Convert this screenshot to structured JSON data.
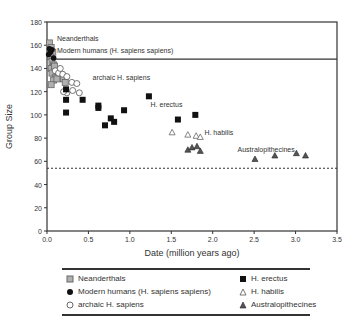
{
  "chart_data": {
    "type": "scatter",
    "title": "",
    "xlabel": "Date (million years ago)",
    "ylabel": "Group Size",
    "xlim": [
      0.0,
      3.5
    ],
    "ylim": [
      0,
      180
    ],
    "xticks": [
      "0.0",
      "0.5",
      "1.0",
      "1.5",
      "2.0",
      "2.5",
      "3.0",
      "3.5"
    ],
    "yticks": [
      "0",
      "20",
      "40",
      "60",
      "80",
      "100",
      "120",
      "140",
      "160",
      "180"
    ],
    "grid": false,
    "legend_position": "below",
    "reference_lines": [
      {
        "type": "horizontal",
        "y": 148,
        "style": "solid",
        "note": "upper band bound (Modern humans)"
      },
      {
        "type": "horizontal",
        "y": 54,
        "style": "dashed"
      }
    ],
    "annotations": [
      {
        "text": "Neanderthals",
        "x": 0.12,
        "y": 164
      },
      {
        "text": "Modern humans (H. sapiens sapiens)",
        "x": 0.12,
        "y": 153
      },
      {
        "text": "archaic H. sapiens",
        "x": 0.55,
        "y": 130
      },
      {
        "text": "H. erectus",
        "x": 1.25,
        "y": 107
      },
      {
        "text": "H. habilis",
        "x": 1.9,
        "y": 83
      },
      {
        "text": "Australopithecines",
        "x": 2.3,
        "y": 68
      }
    ],
    "series": [
      {
        "name": "Neanderthals",
        "marker": "gray-square",
        "points": [
          [
            0.03,
            162
          ],
          [
            0.05,
            158
          ],
          [
            0.07,
            154
          ],
          [
            0.04,
            150
          ],
          [
            0.06,
            146
          ],
          [
            0.08,
            143
          ],
          [
            0.05,
            140
          ],
          [
            0.09,
            142
          ],
          [
            0.06,
            136
          ],
          [
            0.1,
            132
          ],
          [
            0.08,
            130
          ],
          [
            0.05,
            126
          ],
          [
            0.12,
            131
          ],
          [
            0.2,
            131
          ],
          [
            0.22,
            128
          ]
        ]
      },
      {
        "name": "Modern humans (H. sapiens sapiens)",
        "marker": "black-circle",
        "points": [
          [
            0.02,
            152
          ],
          [
            0.04,
            154
          ],
          [
            0.06,
            156
          ],
          [
            0.08,
            149
          ],
          [
            0.03,
            157
          ]
        ]
      },
      {
        "name": "archaic H. sapiens",
        "marker": "open-circle",
        "points": [
          [
            0.1,
            138
          ],
          [
            0.14,
            136
          ],
          [
            0.19,
            135
          ],
          [
            0.24,
            133
          ],
          [
            0.3,
            128
          ],
          [
            0.36,
            127
          ],
          [
            0.31,
            121
          ],
          [
            0.39,
            119
          ],
          [
            0.24,
            119
          ],
          [
            0.2,
            120
          ],
          [
            0.16,
            140
          ]
        ]
      },
      {
        "name": "H. erectus",
        "marker": "black-square",
        "points": [
          [
            0.23,
            122
          ],
          [
            0.23,
            113
          ],
          [
            0.43,
            113
          ],
          [
            0.23,
            102
          ],
          [
            0.62,
            108
          ],
          [
            0.62,
            106
          ],
          [
            0.7,
            91
          ],
          [
            0.77,
            97
          ],
          [
            0.81,
            94
          ],
          [
            0.93,
            104
          ],
          [
            1.23,
            116
          ],
          [
            1.58,
            96
          ],
          [
            1.79,
            100
          ]
        ]
      },
      {
        "name": "H. habilis",
        "marker": "open-triangle",
        "points": [
          [
            1.51,
            85
          ],
          [
            1.7,
            83
          ],
          [
            1.8,
            82
          ],
          [
            1.85,
            81
          ]
        ]
      },
      {
        "name": "Australopithecines",
        "marker": "filled-triangle",
        "points": [
          [
            1.7,
            70
          ],
          [
            1.75,
            72
          ],
          [
            1.81,
            73
          ],
          [
            1.85,
            69
          ],
          [
            2.51,
            62
          ],
          [
            2.75,
            65
          ],
          [
            3.01,
            67
          ],
          [
            3.12,
            65
          ]
        ]
      }
    ]
  },
  "legend": {
    "items": [
      {
        "label": "Neanderthals",
        "marker": "gray-square"
      },
      {
        "label": "Modern humans (H. sapiens sapiens)",
        "marker": "black-circle"
      },
      {
        "label": "archaic H. sapiens",
        "marker": "open-circle"
      },
      {
        "label": "H. erectus",
        "marker": "black-square"
      },
      {
        "label": "H. habilis",
        "marker": "open-triangle"
      },
      {
        "label": "Australopithecines",
        "marker": "filled-triangle"
      }
    ]
  },
  "colors": {
    "axis": "#333333",
    "text": "#333333",
    "gray_marker": "#8c8c8c",
    "black_marker": "#111111",
    "australopithecine_fill": "#666666"
  }
}
